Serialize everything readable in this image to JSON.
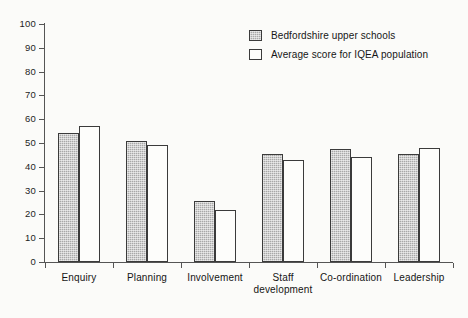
{
  "chart_data": {
    "type": "bar",
    "title": "",
    "subtitle": "",
    "xlabel": "",
    "ylabel": "",
    "ylim": [
      0,
      100
    ],
    "ytick_values": [
      0,
      10,
      20,
      30,
      40,
      50,
      60,
      70,
      80,
      90,
      100
    ],
    "ytick_labels": [
      "0",
      "10",
      "20",
      "30",
      "40",
      "50",
      "60",
      "70",
      "80",
      "90",
      "100"
    ],
    "grid": false,
    "legend_position": "top-right",
    "categories": [
      "Enquiry",
      "Planning",
      "Involvement",
      "Staff development",
      "Co-ordination",
      "Leadership"
    ],
    "category_label_lines": [
      [
        "Enquiry"
      ],
      [
        "Planning"
      ],
      [
        "Involvement"
      ],
      [
        "Staff",
        "development"
      ],
      [
        "Co-ordination"
      ],
      [
        "Leadership"
      ]
    ],
    "series": [
      {
        "name": "Bedfordshire upper schools",
        "values": [
          54,
          51,
          25.5,
          45.5,
          47.5,
          45.5
        ],
        "fill": "#a8a8a8",
        "edge": "#3b3b3b"
      },
      {
        "name": "Average score for IQEA population",
        "values": [
          57,
          49,
          22,
          43,
          44,
          48
        ],
        "fill": "#fdfdfb",
        "edge": "#3b3b3b"
      }
    ]
  },
  "legend": {
    "items": [
      {
        "label": "Bedfordshire upper schools",
        "swatch": "filled-grey-swatch"
      },
      {
        "label": "Average score for IQEA population",
        "swatch": "outlined-white-swatch"
      }
    ]
  },
  "colors": {
    "background": "#fbfbf9",
    "axis": "#555555",
    "text": "#151515",
    "series_a_fill": "#a8a8a8",
    "series_b_fill": "#fdfdfb",
    "bar_edge": "#3b3b3b"
  }
}
